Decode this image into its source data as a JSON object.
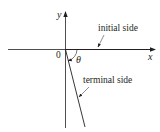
{
  "diagram": {
    "type": "angle-in-standard-position",
    "axes": {
      "x_label": "x",
      "y_label": "y",
      "origin_label": "0"
    },
    "angle": {
      "symbol": "θ",
      "direction": "clockwise (negative angle)"
    },
    "labels": {
      "initial_side": "initial side",
      "terminal_side": "terminal side"
    },
    "colors": {
      "line": "#231f20",
      "background": "#ffffff"
    }
  }
}
